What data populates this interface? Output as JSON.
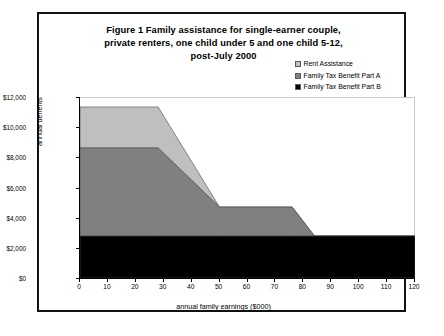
{
  "figure": {
    "title_lines": [
      "Figure 1    Family assistance for single-earner couple,",
      "private renters, one child under 5 and one child 5-12,",
      "post-July 2000"
    ]
  },
  "chart_data": {
    "type": "area",
    "title": "Figure 1    Family assistance for single-earner couple, private renters, one child under 5 and one child 5-12, post-July 2000",
    "xlabel": "annual family earnings ($000)",
    "ylabel": "annual benefits",
    "xlim": [
      0,
      120
    ],
    "ylim": [
      0,
      12000
    ],
    "xticks": [
      0,
      10,
      20,
      30,
      40,
      50,
      60,
      70,
      80,
      90,
      100,
      110,
      120
    ],
    "xticklabels": [
      "0",
      "10",
      "20",
      "30",
      "40",
      "50",
      "60",
      "70",
      "80",
      "90",
      "100",
      "110",
      "120"
    ],
    "yticks": [
      0,
      2000,
      4000,
      6000,
      8000,
      10000,
      12000
    ],
    "yticklabels": [
      "$0",
      "$2,000",
      "$4,000",
      "$6,000",
      "$8,000",
      "$10,000",
      "$12,000"
    ],
    "grid": false,
    "stacked": true,
    "legend_position": "right",
    "x": [
      0,
      28,
      50,
      76,
      84,
      120
    ],
    "series": [
      {
        "name": "Family Tax Benefit Part B",
        "color": "#000000",
        "values": [
          2780,
          2780,
          2780,
          2780,
          2780,
          2780
        ]
      },
      {
        "name": "Family Tax Benefit Part A",
        "color": "#808080",
        "values": [
          5840,
          5840,
          1920,
          1920,
          0,
          0
        ]
      },
      {
        "name": "Rent Assistance",
        "color": "#bfbfbf",
        "values": [
          2720,
          2720,
          0,
          0,
          0,
          0
        ]
      }
    ],
    "cumulative_totals": [
      11340,
      11340,
      4700,
      4700,
      2780,
      2780
    ],
    "annotations": []
  },
  "legend": {
    "items": [
      {
        "label": "Rent Assistance",
        "color": "#bfbfbf"
      },
      {
        "label": "Family Tax Benefit Part A",
        "color": "#808080"
      },
      {
        "label": "Family Tax Benefit Part B",
        "color": "#000000"
      }
    ]
  }
}
